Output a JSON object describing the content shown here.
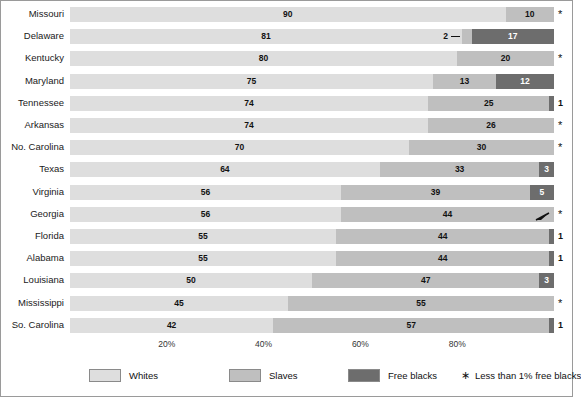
{
  "chart_data": {
    "type": "bar",
    "subtype": "stacked-horizontal-100pct",
    "title": "",
    "subtitle": "",
    "xlabel": "",
    "ylabel": "",
    "xlim": [
      0,
      100
    ],
    "xticks": [
      "20%",
      "40%",
      "60%",
      "80%"
    ],
    "xtick_values": [
      20,
      40,
      60,
      80
    ],
    "grid": false,
    "legend_position": "bottom",
    "series": [
      {
        "name": "Whites",
        "color": "#dedede"
      },
      {
        "name": "Slaves",
        "color": "#bfbfbf"
      },
      {
        "name": "Free blacks",
        "color": "#6d6d6d"
      }
    ],
    "categories": [
      "Missouri",
      "Delaware",
      "Kentucky",
      "Maryland",
      "Tennessee",
      "Arkansas",
      "No. Carolina",
      "Texas",
      "Virginia",
      "Georgia",
      "Florida",
      "Alabama",
      "Louisiana",
      "Mississippi",
      "So. Carolina"
    ],
    "rows": [
      {
        "state": "Missouri",
        "whites": 90,
        "slaves": 10,
        "free_blacks": 0,
        "whites_label": "90",
        "slaves_label": "10",
        "free_label": "*",
        "marker": "*",
        "marker_kind": "asterisk"
      },
      {
        "state": "Delaware",
        "whites": 81,
        "slaves": 2,
        "free_blacks": 17,
        "whites_label": "81",
        "slaves_label": "2",
        "free_label": "17",
        "marker": "",
        "marker_kind": "none",
        "slaves_leader": true
      },
      {
        "state": "Kentucky",
        "whites": 80,
        "slaves": 20,
        "free_blacks": 0,
        "whites_label": "80",
        "slaves_label": "20",
        "free_label": "*",
        "marker": "*",
        "marker_kind": "asterisk"
      },
      {
        "state": "Maryland",
        "whites": 75,
        "slaves": 13,
        "free_blacks": 12,
        "whites_label": "75",
        "slaves_label": "13",
        "free_label": "12",
        "marker": "",
        "marker_kind": "none"
      },
      {
        "state": "Tennessee",
        "whites": 74,
        "slaves": 25,
        "free_blacks": 1,
        "whites_label": "74",
        "slaves_label": "25",
        "free_label": "1",
        "marker": "1",
        "marker_kind": "number"
      },
      {
        "state": "Arkansas",
        "whites": 74,
        "slaves": 26,
        "free_blacks": 0,
        "whites_label": "74",
        "slaves_label": "26",
        "free_label": "*",
        "marker": "*",
        "marker_kind": "asterisk"
      },
      {
        "state": "No. Carolina",
        "whites": 70,
        "slaves": 30,
        "free_blacks": 0,
        "whites_label": "70",
        "slaves_label": "30",
        "free_label": "*",
        "marker": "*",
        "marker_kind": "asterisk"
      },
      {
        "state": "Texas",
        "whites": 64,
        "slaves": 33,
        "free_blacks": 3,
        "whites_label": "64",
        "slaves_label": "33",
        "free_label": "3",
        "marker": "",
        "marker_kind": "none",
        "free_inside": true
      },
      {
        "state": "Virginia",
        "whites": 56,
        "slaves": 39,
        "free_blacks": 5,
        "whites_label": "56",
        "slaves_label": "39",
        "free_label": "5",
        "marker": "",
        "marker_kind": "none",
        "free_inside": true
      },
      {
        "state": "Georgia",
        "whites": 56,
        "slaves": 44,
        "free_blacks": 0,
        "whites_label": "56",
        "slaves_label": "44",
        "free_label": "*",
        "marker": "*",
        "marker_kind": "asterisk",
        "callout": true
      },
      {
        "state": "Florida",
        "whites": 55,
        "slaves": 44,
        "free_blacks": 1,
        "whites_label": "55",
        "slaves_label": "44",
        "free_label": "1",
        "marker": "1",
        "marker_kind": "number"
      },
      {
        "state": "Alabama",
        "whites": 55,
        "slaves": 44,
        "free_blacks": 1,
        "whites_label": "55",
        "slaves_label": "44",
        "free_label": "1",
        "marker": "1",
        "marker_kind": "number"
      },
      {
        "state": "Louisiana",
        "whites": 50,
        "slaves": 47,
        "free_blacks": 3,
        "whites_label": "50",
        "slaves_label": "47",
        "free_label": "3",
        "marker": "",
        "marker_kind": "none",
        "free_inside": true
      },
      {
        "state": "Mississippi",
        "whites": 45,
        "slaves": 55,
        "free_blacks": 0,
        "whites_label": "45",
        "slaves_label": "55",
        "free_label": "*",
        "marker": "*",
        "marker_kind": "asterisk"
      },
      {
        "state": "So. Carolina",
        "whites": 42,
        "slaves": 57,
        "free_blacks": 1,
        "whites_label": "42",
        "slaves_label": "57",
        "free_label": "1",
        "marker": "1",
        "marker_kind": "number"
      }
    ]
  },
  "legend": {
    "items": [
      {
        "label": "Whites",
        "color": "#dedede"
      },
      {
        "label": "Slaves",
        "color": "#bfbfbf"
      },
      {
        "label": "Free blacks",
        "color": "#6d6d6d"
      }
    ],
    "footnote_glyph": "∗",
    "footnote": "Less than 1% free blacks"
  }
}
